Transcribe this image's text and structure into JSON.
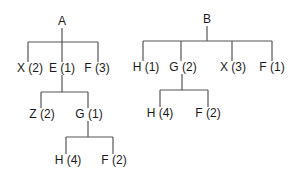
{
  "colors": {
    "line": "#555555",
    "text": "#1a1a1a",
    "background": "#ffffff"
  },
  "trees": [
    {
      "root": "A",
      "nodes": [
        {
          "id": "A",
          "label": "A",
          "x": 62,
          "y": 21
        },
        {
          "id": "X2",
          "label": "X (2)",
          "x": 30,
          "y": 68
        },
        {
          "id": "E1",
          "label": "E (1)",
          "x": 62,
          "y": 68
        },
        {
          "id": "F3",
          "label": "F (3)",
          "x": 97,
          "y": 68
        },
        {
          "id": "Z2",
          "label": "Z (2)",
          "x": 42,
          "y": 114
        },
        {
          "id": "G1",
          "label": "G (1)",
          "x": 89,
          "y": 114
        },
        {
          "id": "H4a",
          "label": "H (4)",
          "x": 68,
          "y": 160
        },
        {
          "id": "F2a",
          "label": "F (2)",
          "x": 114,
          "y": 160
        }
      ],
      "edges": [
        [
          "A",
          "X2"
        ],
        [
          "A",
          "E1"
        ],
        [
          "A",
          "F3"
        ],
        [
          "E1",
          "Z2"
        ],
        [
          "E1",
          "G1"
        ],
        [
          "G1",
          "H4a"
        ],
        [
          "G1",
          "F2a"
        ]
      ]
    },
    {
      "root": "B",
      "nodes": [
        {
          "id": "B",
          "label": "B",
          "x": 207,
          "y": 19
        },
        {
          "id": "H1",
          "label": "H (1)",
          "x": 146,
          "y": 67
        },
        {
          "id": "G2",
          "label": "G (2)",
          "x": 183,
          "y": 67
        },
        {
          "id": "X3",
          "label": "X (3)",
          "x": 233,
          "y": 67
        },
        {
          "id": "F1",
          "label": "F (1)",
          "x": 272,
          "y": 67
        },
        {
          "id": "H4b",
          "label": "H (4)",
          "x": 160,
          "y": 113
        },
        {
          "id": "F2b",
          "label": "F (2)",
          "x": 208,
          "y": 113
        }
      ],
      "edges": [
        [
          "B",
          "H1"
        ],
        [
          "B",
          "G2"
        ],
        [
          "B",
          "X3"
        ],
        [
          "B",
          "F1"
        ],
        [
          "G2",
          "H4b"
        ],
        [
          "G2",
          "F2b"
        ]
      ]
    }
  ],
  "connectors": [
    {
      "parent": "A",
      "stem": [
        62,
        28,
        62,
        42
      ],
      "bar": [
        28,
        42,
        98,
        42
      ],
      "drops": [
        [
          28,
          42,
          28,
          62
        ],
        [
          62,
          42,
          62,
          62
        ],
        [
          98,
          42,
          98,
          62
        ]
      ]
    },
    {
      "parent": "E1",
      "stem": [
        62,
        75,
        62,
        92
      ],
      "bar": [
        41,
        92,
        88,
        92
      ],
      "drops": [
        [
          41,
          92,
          41,
          108
        ],
        [
          88,
          92,
          88,
          108
        ]
      ]
    },
    {
      "parent": "G1",
      "stem": [
        88,
        121,
        88,
        137
      ],
      "bar": [
        66,
        137,
        113,
        137
      ],
      "drops": [
        [
          66,
          137,
          66,
          154
        ],
        [
          113,
          137,
          113,
          154
        ]
      ]
    },
    {
      "parent": "B",
      "stem": [
        207,
        26,
        207,
        41
      ],
      "bar": [
        143,
        41,
        272,
        41
      ],
      "drops": [
        [
          143,
          41,
          143,
          61
        ],
        [
          181,
          41,
          181,
          61
        ],
        [
          232,
          41,
          232,
          61
        ],
        [
          272,
          41,
          272,
          61
        ]
      ]
    },
    {
      "parent": "G2",
      "stem": [
        182,
        74,
        182,
        90
      ],
      "bar": [
        160,
        90,
        208,
        90
      ],
      "drops": [
        [
          160,
          90,
          160,
          107
        ],
        [
          208,
          90,
          208,
          107
        ]
      ]
    }
  ]
}
